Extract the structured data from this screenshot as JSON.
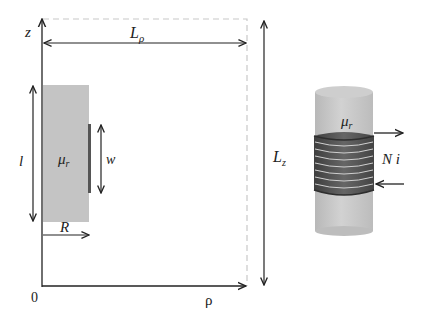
{
  "figure": {
    "left_panel": {
      "axes": {
        "vertical_label": "z",
        "horizontal_label": "ρ",
        "origin_label": "0"
      },
      "dimensions": {
        "width_label_base": "L",
        "width_label_sub": "ρ",
        "height_label_base": "L",
        "height_label_sub": "z",
        "core_length_label": "l",
        "coil_width_label": "w",
        "radius_label": "R"
      },
      "core": {
        "label_base": "μ",
        "label_sub": "r"
      }
    },
    "right_panel": {
      "core": {
        "label_base": "μ",
        "label_sub": "r"
      },
      "coil": {
        "label": "N i",
        "turns": 8
      }
    },
    "colors": {
      "core_fill": "#c4c4c4",
      "coil_dark": "#5a5a5a",
      "coil_stripe": "#cfcfcf",
      "axis": "#222222",
      "dashed_boundary": "#c8c8c8"
    }
  }
}
